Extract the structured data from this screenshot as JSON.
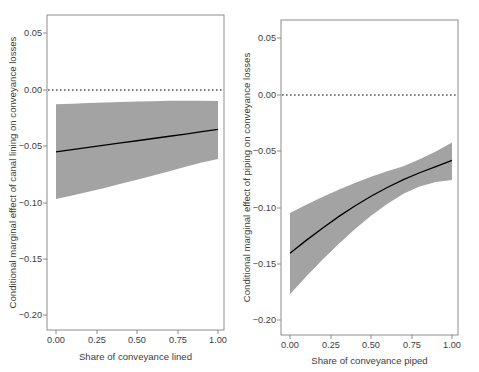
{
  "figure": {
    "background": "#ffffff",
    "band_color": "#9e9e9e",
    "line_color": "#000000",
    "axis_color": "#808080",
    "text_color": "#3d3d3d",
    "reference_line_value": "0.00"
  },
  "chart_data": [
    {
      "type": "line",
      "panel": "left",
      "title": "",
      "xlabel": "Share of conveyance lined",
      "ylabel": "Conditional marginal effect of canal lining on conveyance losses",
      "xlim": [
        0.0,
        1.0
      ],
      "ylim": [
        -0.215,
        0.068
      ],
      "xticks": [
        0.0,
        0.25,
        0.5,
        0.75,
        1.0
      ],
      "xticklabels": [
        "0.00",
        "0.25",
        "0.50",
        "0.75",
        "1.00"
      ],
      "yticks": [
        0.05,
        0.0,
        -0.05,
        -0.1,
        -0.15,
        -0.2
      ],
      "yticklabels": [
        "0.05",
        "0.00",
        "-0.05",
        "-0.10",
        "-0.15",
        "-0.20"
      ],
      "grid": false,
      "legend": "none",
      "reference_line": {
        "y": 0.0,
        "style": "dotted"
      },
      "x": [
        0.0,
        0.1,
        0.2,
        0.3,
        0.4,
        0.5,
        0.6,
        0.7,
        0.8,
        0.9,
        1.0
      ],
      "series": [
        {
          "name": "Conditional marginal effect",
          "values": [
            -0.0553,
            -0.0533,
            -0.0513,
            -0.0493,
            -0.0473,
            -0.0453,
            -0.0433,
            -0.0413,
            -0.0393,
            -0.0372,
            -0.0352
          ]
        },
        {
          "name": "95% CI upper",
          "values": [
            -0.0128,
            -0.0122,
            -0.0117,
            -0.0112,
            -0.0107,
            -0.0103,
            -0.01,
            -0.0097,
            -0.0096,
            -0.0096,
            -0.0098
          ]
        },
        {
          "name": "95% CI lower",
          "values": [
            -0.0973,
            -0.0941,
            -0.0908,
            -0.0874,
            -0.0838,
            -0.0801,
            -0.0763,
            -0.0725,
            -0.0686,
            -0.0648,
            -0.0616
          ]
        }
      ]
    },
    {
      "type": "line",
      "panel": "right",
      "title": "",
      "xlabel": "Share of conveyance piped",
      "ylabel": "Conditional marginal effect of piping on conveyance losses",
      "xlim": [
        0.0,
        1.0
      ],
      "ylim": [
        -0.215,
        0.068
      ],
      "xticks": [
        0.0,
        0.25,
        0.5,
        0.75,
        1.0
      ],
      "xticklabels": [
        "0.00",
        "0.25",
        "0.50",
        "0.75",
        "1.00"
      ],
      "yticks": [
        0.05,
        0.0,
        -0.05,
        -0.1,
        -0.15,
        -0.2
      ],
      "yticklabels": [
        "0.05",
        "0.00",
        "-0.05",
        "-0.10",
        "-0.15",
        "-0.20"
      ],
      "grid": false,
      "legend": "none",
      "reference_line": {
        "y": 0.0,
        "style": "dotted"
      },
      "x": [
        0.0,
        0.1,
        0.2,
        0.3,
        0.4,
        0.5,
        0.6,
        0.7,
        0.8,
        0.9,
        1.0
      ],
      "series": [
        {
          "name": "Conditional marginal effect",
          "values": [
            -0.1412,
            -0.1298,
            -0.1189,
            -0.1086,
            -0.0991,
            -0.0904,
            -0.0826,
            -0.0756,
            -0.0694,
            -0.064,
            -0.0583
          ]
        },
        {
          "name": "95% CI upper",
          "values": [
            -0.1053,
            -0.098,
            -0.0911,
            -0.0846,
            -0.0786,
            -0.0731,
            -0.0681,
            -0.0636,
            -0.0573,
            -0.0505,
            -0.0424
          ]
        },
        {
          "name": "95% CI lower",
          "values": [
            -0.1778,
            -0.162,
            -0.147,
            -0.133,
            -0.1199,
            -0.1079,
            -0.0973,
            -0.0882,
            -0.0818,
            -0.0776,
            -0.0758
          ]
        }
      ]
    }
  ]
}
